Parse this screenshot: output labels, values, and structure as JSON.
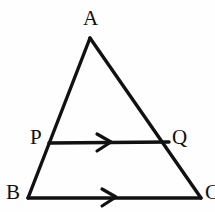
{
  "figure": {
    "name": "triangle-abc-with-midsegment-pq",
    "background_color": "#fefefe",
    "stroke_color": "#111111",
    "stroke_width": 3.4,
    "labels": {
      "apex": "A",
      "left_base": "B",
      "right_base": "C",
      "left_segment_point": "P",
      "right_segment_point": "Q"
    },
    "points": {
      "A": {
        "x": 90,
        "y": 38
      },
      "B": {
        "x": 28,
        "y": 198
      },
      "C": {
        "x": 201,
        "y": 198
      },
      "P": {
        "x": 49,
        "y": 143
      },
      "Q": {
        "x": 169,
        "y": 142
      }
    },
    "segments": [
      {
        "name": "side-ab",
        "from": "A",
        "to": "B"
      },
      {
        "name": "side-ac",
        "from": "A",
        "to": "C"
      },
      {
        "name": "base-bc",
        "from": "B",
        "to": "C"
      },
      {
        "name": "segment-pq",
        "from": "P",
        "to": "Q"
      }
    ],
    "parallel_marks": [
      {
        "name": "arrow-marker-pq",
        "on": "segment-pq",
        "x": 106,
        "y": 142,
        "direction": "right",
        "count": 1
      },
      {
        "name": "arrow-marker-bc",
        "on": "base-bc",
        "x": 111,
        "y": 197,
        "direction": "right",
        "count": 1
      }
    ]
  }
}
